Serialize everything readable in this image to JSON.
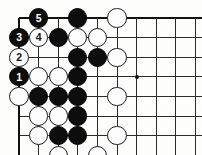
{
  "diagram": {
    "kind": "go-board-corner-diagram",
    "title": "",
    "board": {
      "origin_x": 19,
      "origin_y": 18,
      "spacing": 19.6,
      "cols": 9,
      "rows": 8,
      "corner": "top-left",
      "line_color": "#2b2b2b",
      "edge_color": "#111111",
      "background": "#fdfdfb"
    },
    "star_points": [
      {
        "col": 6,
        "row": 3,
        "label": "hoshi"
      }
    ],
    "stones": [
      {
        "col": 3,
        "row": 0,
        "color": "black",
        "label": ""
      },
      {
        "col": 5,
        "row": 0,
        "color": "white",
        "label": ""
      },
      {
        "col": 2,
        "row": 1,
        "color": "black",
        "label": ""
      },
      {
        "col": 3,
        "row": 1,
        "color": "white",
        "label": ""
      },
      {
        "col": 4,
        "row": 1,
        "color": "white",
        "label": ""
      },
      {
        "col": 3,
        "row": 2,
        "color": "black",
        "label": ""
      },
      {
        "col": 4,
        "row": 2,
        "color": "black",
        "label": ""
      },
      {
        "col": 5,
        "row": 2,
        "color": "white",
        "label": ""
      },
      {
        "col": 1,
        "row": 3,
        "color": "white",
        "label": ""
      },
      {
        "col": 2,
        "row": 3,
        "color": "white",
        "label": ""
      },
      {
        "col": 3,
        "row": 3,
        "color": "black",
        "label": ""
      },
      {
        "col": 0,
        "row": 4,
        "color": "white",
        "label": ""
      },
      {
        "col": 1,
        "row": 4,
        "color": "black",
        "label": ""
      },
      {
        "col": 2,
        "row": 4,
        "color": "black",
        "label": ""
      },
      {
        "col": 3,
        "row": 4,
        "color": "black",
        "label": ""
      },
      {
        "col": 5,
        "row": 4,
        "color": "white",
        "label": ""
      },
      {
        "col": 1,
        "row": 5,
        "color": "white",
        "label": ""
      },
      {
        "col": 2,
        "row": 5,
        "color": "white",
        "label": ""
      },
      {
        "col": 3,
        "row": 5,
        "color": "black",
        "label": ""
      },
      {
        "col": 1,
        "row": 6,
        "color": "white",
        "label": ""
      },
      {
        "col": 2,
        "row": 6,
        "color": "black",
        "label": ""
      },
      {
        "col": 3,
        "row": 6,
        "color": "black",
        "label": ""
      },
      {
        "col": 5,
        "row": 6,
        "color": "white",
        "label": ""
      },
      {
        "col": 2,
        "row": 7,
        "color": "white",
        "label": ""
      },
      {
        "col": 4,
        "row": 7,
        "color": "white",
        "label": ""
      },
      {
        "col": 2,
        "row": 8,
        "color": "white",
        "label": ""
      }
    ],
    "numbered_moves": [
      {
        "col": 0,
        "row": 3,
        "color": "black",
        "label": "1",
        "move_number": 1
      },
      {
        "col": 0,
        "row": 2,
        "color": "white",
        "label": "2",
        "move_number": 2
      },
      {
        "col": 0,
        "row": 1,
        "color": "black",
        "label": "3",
        "move_number": 3
      },
      {
        "col": 1,
        "row": 1,
        "color": "white",
        "label": "4",
        "move_number": 4
      },
      {
        "col": 1,
        "row": 0,
        "color": "black",
        "label": "5",
        "move_number": 5
      }
    ]
  }
}
